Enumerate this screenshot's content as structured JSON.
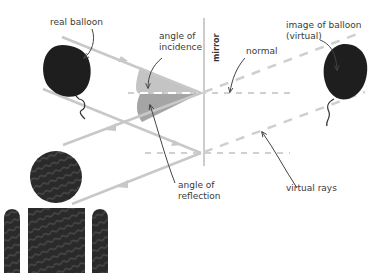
{
  "diagram": {
    "labels": {
      "real_balloon": "real balloon",
      "angle_of_incidence_line1": "angle of",
      "angle_of_incidence_line2": "incidence",
      "mirror": "mirror",
      "normal": "normal",
      "image_of_balloon_line1": "image of balloon",
      "image_of_balloon_line2": "(virtual)",
      "angle_of_reflection_line1": "angle of",
      "angle_of_reflection_line2": "reflection",
      "virtual_rays": "virtual rays"
    },
    "elements": {
      "real_balloon": "balloon-icon",
      "virtual_balloon": "balloon-icon",
      "observer": "person-icon",
      "mirror": "vertical-line",
      "incident_rays": 2,
      "reflected_rays": 2,
      "normals": 2,
      "virtual_rays": 2
    },
    "colors": {
      "ray": "#c8c8c8",
      "dashed": "#cfcfcf",
      "mirror": "#cccccc",
      "balloon": "#1e1e1e",
      "angle_fill": "#bdbdbd",
      "angle_fill_dark": "#9a9a9a",
      "text": "#3a3a3a",
      "pointer": "#444444"
    }
  }
}
